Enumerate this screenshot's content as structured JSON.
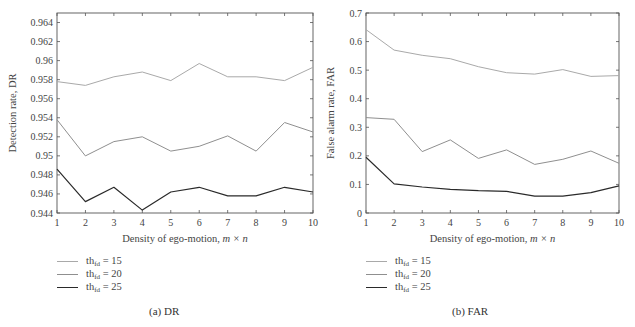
{
  "chart_data": [
    {
      "type": "line",
      "panel": "a",
      "caption": "(a)  DR",
      "title": "",
      "xlabel": "Density of ego-motion, m × n",
      "xlabel_plain": "Density of ego-motion, ",
      "xlabel_math": "m × n",
      "ylabel": "Detection rate, DR",
      "x": [
        1,
        2,
        3,
        4,
        5,
        6,
        7,
        8,
        9,
        10
      ],
      "xlim": [
        1,
        10
      ],
      "ylim": [
        0.944,
        0.965
      ],
      "yticks": [
        0.944,
        0.946,
        0.948,
        0.95,
        0.952,
        0.954,
        0.956,
        0.958,
        0.96,
        0.962,
        0.964
      ],
      "ytick_labels": [
        "0.944",
        "0.946",
        "0.948",
        "0.95",
        "0.952",
        "0.954",
        "0.956",
        "0.958",
        "0.96",
        "0.962",
        "0.964"
      ],
      "grid": false,
      "legend_position": "below",
      "series": [
        {
          "name": "th_fd = 15",
          "color": "#a9a9a9",
          "values": [
            0.9578,
            0.9574,
            0.9583,
            0.9588,
            0.9579,
            0.9597,
            0.9583,
            0.9583,
            0.9579,
            0.9593
          ]
        },
        {
          "name": "th_fd = 20",
          "color": "#8f8f8f",
          "values": [
            0.9538,
            0.95,
            0.9515,
            0.952,
            0.9505,
            0.951,
            0.9521,
            0.9505,
            0.9535,
            0.9525
          ]
        },
        {
          "name": "th_fd = 25",
          "color": "#2a2a2a",
          "values": [
            0.9486,
            0.9452,
            0.9467,
            0.9443,
            0.9462,
            0.9467,
            0.9458,
            0.9458,
            0.9467,
            0.9462
          ]
        }
      ]
    },
    {
      "type": "line",
      "panel": "b",
      "caption": "(b)  FAR",
      "title": "",
      "xlabel": "Density of ego-motion, m × n",
      "xlabel_plain": "Density of ego-motion, ",
      "xlabel_math": "m × n",
      "ylabel": "False alarm rate, FAR",
      "x": [
        1,
        2,
        3,
        4,
        5,
        6,
        7,
        8,
        9,
        10
      ],
      "xlim": [
        1,
        10
      ],
      "ylim": [
        0,
        0.7
      ],
      "yticks": [
        0,
        0.1,
        0.2,
        0.3,
        0.4,
        0.5,
        0.6,
        0.7
      ],
      "ytick_labels": [
        "0",
        "0.1",
        "0.2",
        "0.3",
        "0.4",
        "0.5",
        "0.6",
        "0.7"
      ],
      "grid": false,
      "legend_position": "below",
      "series": [
        {
          "name": "th_fd = 15",
          "color": "#a9a9a9",
          "values": [
            0.642,
            0.57,
            0.552,
            0.54,
            0.512,
            0.491,
            0.486,
            0.502,
            0.478,
            0.481
          ]
        },
        {
          "name": "th_fd = 20",
          "color": "#8f8f8f",
          "values": [
            0.334,
            0.328,
            0.215,
            0.256,
            0.191,
            0.221,
            0.17,
            0.188,
            0.217,
            0.174
          ]
        },
        {
          "name": "th_fd = 25",
          "color": "#2a2a2a",
          "values": [
            0.195,
            0.102,
            0.091,
            0.083,
            0.078,
            0.076,
            0.059,
            0.059,
            0.071,
            0.095
          ]
        }
      ]
    }
  ],
  "legend": {
    "items": [
      {
        "prefix": "th",
        "sub": "fd",
        "suffix": " = 15"
      },
      {
        "prefix": "th",
        "sub": "fd",
        "suffix": " = 20"
      },
      {
        "prefix": "th",
        "sub": "fd",
        "suffix": " = 25"
      }
    ]
  }
}
